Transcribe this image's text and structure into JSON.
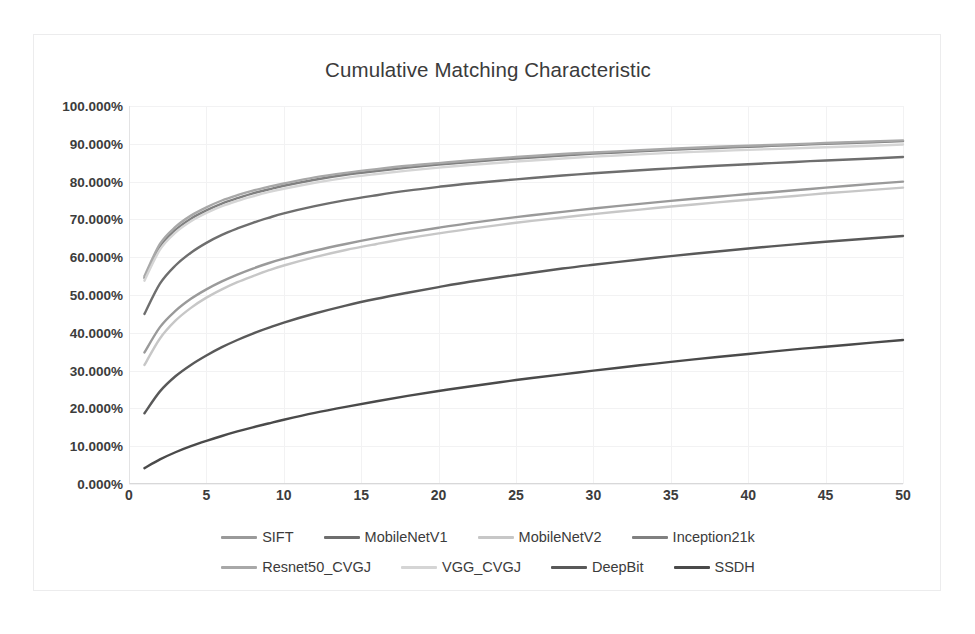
{
  "chart_data": {
    "type": "line",
    "title": "Cumulative Matching Characteristic",
    "xlabel": "",
    "ylabel": "",
    "xlim": [
      0,
      50
    ],
    "ylim": [
      0,
      100
    ],
    "grid": true,
    "legend_position": "bottom",
    "x_ticks": [
      "0",
      "5",
      "10",
      "15",
      "20",
      "25",
      "30",
      "35",
      "40",
      "45",
      "50"
    ],
    "y_ticks": [
      "0.000%",
      "10.000%",
      "20.000%",
      "30.000%",
      "40.000%",
      "50.000%",
      "60.000%",
      "70.000%",
      "80.000%",
      "90.000%",
      "100.000%"
    ],
    "x": [
      1,
      2,
      3,
      4,
      5,
      6,
      7,
      8,
      9,
      10,
      12,
      14,
      16,
      18,
      20,
      22,
      25,
      28,
      30,
      33,
      35,
      38,
      40,
      43,
      45,
      48,
      50
    ],
    "series": [
      {
        "name": "SIFT",
        "color": "#9a9a9a",
        "values": [
          34.8,
          41.5,
          45.8,
          49.0,
          51.5,
          53.6,
          55.4,
          57.0,
          58.4,
          59.6,
          61.7,
          63.5,
          65.1,
          66.5,
          67.8,
          69.0,
          70.6,
          72.0,
          72.9,
          74.1,
          74.9,
          76.0,
          76.7,
          77.7,
          78.4,
          79.4,
          80.0
        ]
      },
      {
        "name": "MobileNetV1",
        "color": "#6e6e6e",
        "values": [
          45.0,
          53.0,
          57.8,
          61.2,
          63.8,
          65.9,
          67.6,
          69.1,
          70.4,
          71.6,
          73.5,
          75.1,
          76.4,
          77.6,
          78.6,
          79.5,
          80.6,
          81.6,
          82.2,
          83.0,
          83.5,
          84.2,
          84.6,
          85.2,
          85.6,
          86.1,
          86.5
        ]
      },
      {
        "name": "MobileNetV2",
        "color": "#c7c7c7",
        "values": [
          31.5,
          38.5,
          43.2,
          46.6,
          49.3,
          51.5,
          53.4,
          55.0,
          56.5,
          57.8,
          60.0,
          61.9,
          63.5,
          65.0,
          66.3,
          67.5,
          69.1,
          70.5,
          71.4,
          72.6,
          73.4,
          74.5,
          75.2,
          76.2,
          76.9,
          77.8,
          78.4
        ]
      },
      {
        "name": "Inception21k",
        "color": "#808080",
        "values": [
          54.5,
          62.8,
          67.2,
          70.2,
          72.4,
          74.2,
          75.6,
          76.9,
          77.9,
          78.9,
          80.5,
          81.8,
          82.8,
          83.7,
          84.5,
          85.2,
          86.1,
          86.9,
          87.4,
          88.0,
          88.4,
          88.9,
          89.2,
          89.7,
          90.0,
          90.4,
          90.7
        ]
      },
      {
        "name": "Resnet50_CVGJ",
        "color": "#a8a8a8",
        "values": [
          55.0,
          63.5,
          68.0,
          71.0,
          73.2,
          75.0,
          76.4,
          77.6,
          78.6,
          79.5,
          81.1,
          82.3,
          83.3,
          84.2,
          84.9,
          85.6,
          86.5,
          87.3,
          87.7,
          88.3,
          88.7,
          89.2,
          89.5,
          89.9,
          90.2,
          90.6,
          90.9
        ]
      },
      {
        "name": "VGG_CVGJ",
        "color": "#d5d5d5",
        "values": [
          53.8,
          62.0,
          66.5,
          69.5,
          71.7,
          73.5,
          74.9,
          76.1,
          77.2,
          78.1,
          79.7,
          81.0,
          82.0,
          82.9,
          83.7,
          84.4,
          85.3,
          86.1,
          86.6,
          87.2,
          87.6,
          88.1,
          88.4,
          88.8,
          89.1,
          89.5,
          89.8
        ]
      },
      {
        "name": "DeepBit",
        "color": "#595959",
        "values": [
          18.7,
          24.5,
          28.5,
          31.5,
          34.0,
          36.2,
          38.1,
          39.8,
          41.3,
          42.7,
          45.1,
          47.2,
          49.0,
          50.6,
          52.1,
          53.5,
          55.3,
          57.0,
          58.0,
          59.4,
          60.3,
          61.5,
          62.3,
          63.4,
          64.1,
          65.0,
          65.6
        ]
      },
      {
        "name": "SSDH",
        "color": "#4a4a4a",
        "values": [
          4.2,
          6.5,
          8.4,
          10.0,
          11.4,
          12.7,
          13.9,
          15.0,
          16.0,
          17.0,
          18.8,
          20.4,
          21.9,
          23.3,
          24.6,
          25.8,
          27.5,
          29.0,
          30.0,
          31.4,
          32.3,
          33.6,
          34.4,
          35.6,
          36.3,
          37.4,
          38.1
        ]
      }
    ],
    "legend_rows": [
      [
        "SIFT",
        "MobileNetV1",
        "MobileNetV2",
        "Inception21k"
      ],
      [
        "Resnet50_CVGJ",
        "VGG_CVGJ",
        "DeepBit",
        "SSDH"
      ]
    ]
  }
}
